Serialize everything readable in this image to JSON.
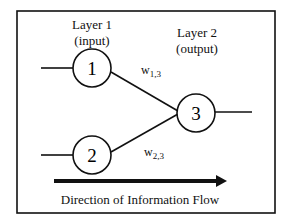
{
  "diagram": {
    "layers": [
      {
        "title": "Layer 1",
        "subtitle": "(input)"
      },
      {
        "title": "Layer 2",
        "subtitle": "(output)"
      }
    ],
    "nodes": [
      {
        "id": "1",
        "label": "1",
        "layer": 1
      },
      {
        "id": "2",
        "label": "2",
        "layer": 1
      },
      {
        "id": "3",
        "label": "3",
        "layer": 2
      }
    ],
    "edges": [
      {
        "from": "1",
        "to": "3",
        "weight_base": "w",
        "weight_sub": "1,3"
      },
      {
        "from": "2",
        "to": "3",
        "weight_base": "w",
        "weight_sub": "2,3"
      }
    ],
    "flow_label": "Direction of Information Flow"
  },
  "colors": {
    "stroke": "#111111",
    "background": "#ffffff"
  }
}
